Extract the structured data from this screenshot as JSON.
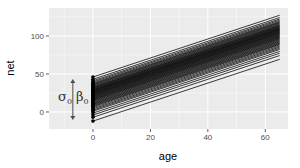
{
  "chart_data": {
    "type": "line",
    "title": "",
    "xlabel": "age",
    "ylabel": "net",
    "xlim": [
      -15.3,
      67.9
    ],
    "ylim": [
      -22.4,
      136.8
    ],
    "x_ticks": [
      0,
      20,
      40,
      60
    ],
    "x_tick_labels": [
      "0",
      "20",
      "40",
      "60"
    ],
    "y_ticks": [
      0,
      50,
      100
    ],
    "y_tick_labels": [
      "0",
      "50",
      "100"
    ],
    "x_minor": [
      -10,
      10,
      30,
      50
    ],
    "y_minor": [
      -25,
      25,
      75,
      125
    ],
    "grid": true,
    "legend": "none",
    "line_color": "#000000",
    "point_color": "#000000",
    "panel_background": "#ebebeb",
    "grid_color": "#ffffff",
    "slope": 1.25,
    "line_x_range": [
      0,
      65
    ],
    "intercepts": [
      46,
      43,
      41,
      39.5,
      38,
      37,
      36,
      35,
      34,
      33,
      32.2,
      31.5,
      30.8,
      30,
      29.3,
      28.6,
      28,
      27.4,
      26.8,
      26,
      25.4,
      24.8,
      24,
      23.3,
      22.7,
      22,
      21.3,
      20.5,
      19.7,
      19,
      18.2,
      17.4,
      16.6,
      15.8,
      15,
      14,
      13,
      12,
      11,
      10,
      9,
      8,
      7,
      5.5,
      4,
      2.5,
      1,
      -1.5,
      -4,
      -7,
      -12
    ],
    "annotation": {
      "text_sigma": "σ",
      "sub_sigma": "0",
      "text_beta": "β",
      "sub_beta": "0",
      "arrow_x": -7,
      "arrow_y_range": [
        -10.5,
        43.5
      ],
      "description": "double-headed arrow showing spread σ0 of intercepts β0"
    }
  }
}
